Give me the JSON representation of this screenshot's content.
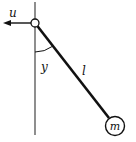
{
  "diagram": {
    "labels": {
      "force": "u",
      "angle": "y",
      "length": "l",
      "mass": "m"
    },
    "colors": {
      "stroke": "#111111",
      "axis": "#444444",
      "background": "#ffffff"
    }
  }
}
